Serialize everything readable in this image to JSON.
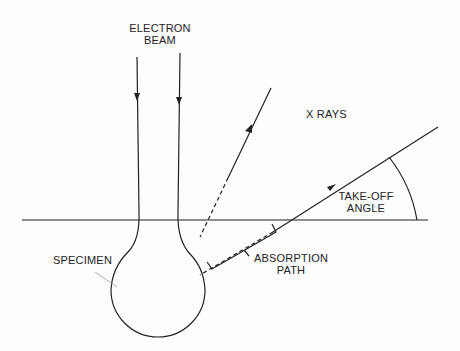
{
  "diagram": {
    "labels": {
      "electron_beam_line1": "ELECTRON",
      "electron_beam_line2": "BEAM",
      "x_rays": "X RAYS",
      "take_off_line1": "TAKE-OFF",
      "take_off_line2": "ANGLE",
      "specimen": "SPECIMEN",
      "absorption_line1": "ABSORPTION",
      "absorption_line2": "PATH"
    },
    "colors": {
      "line": "#222222",
      "background": "#fdfdfd"
    }
  }
}
